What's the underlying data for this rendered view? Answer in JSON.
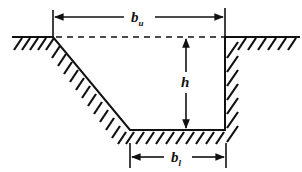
{
  "diagram": {
    "type": "trapezoidal channel cross-section",
    "labels": {
      "top_width": {
        "main": "b",
        "sub": "u"
      },
      "depth": {
        "main": "h"
      },
      "bottom_width": {
        "main": "b",
        "sub": "l"
      }
    },
    "colors": {
      "line": "#111111",
      "background": "#ffffff"
    }
  }
}
